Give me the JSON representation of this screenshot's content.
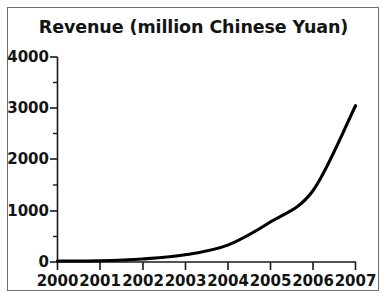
{
  "chart_data": {
    "type": "line",
    "title": "Revenue (million Chinese Yuan)",
    "xlabel": "",
    "ylabel": "",
    "x": [
      2000,
      2001,
      2002,
      2003,
      2004,
      2005,
      2006,
      2007
    ],
    "categories": [
      "2000",
      "2001",
      "2002",
      "2003",
      "2004",
      "2005",
      "2006",
      "2007"
    ],
    "values": [
      20,
      25,
      60,
      140,
      330,
      780,
      1390,
      3050
    ],
    "series": [
      {
        "name": "Revenue",
        "values": [
          20,
          25,
          60,
          140,
          330,
          780,
          1390,
          3050
        ]
      }
    ],
    "xlim": [
      2000,
      2007
    ],
    "ylim": [
      0,
      4000
    ],
    "ytick_labels": [
      "0",
      "1000",
      "2000",
      "3000",
      "4000"
    ],
    "ytick_values": [
      0,
      1000,
      2000,
      3000,
      4000
    ],
    "yminor_values": [
      500,
      1500,
      2500,
      3500
    ],
    "xtick_labels": [
      "2000",
      "2001",
      "2002",
      "2003",
      "2004",
      "2005",
      "2006",
      "2007"
    ],
    "grid": false,
    "legend": false,
    "legend_position": "none",
    "line_color": "#000000",
    "frame_color": "#6e6e6e",
    "axis_color": "#1a1a1a",
    "background_color": "#ffffff"
  },
  "figure": {
    "title": "Revenue (million Chinese Yuan)"
  }
}
